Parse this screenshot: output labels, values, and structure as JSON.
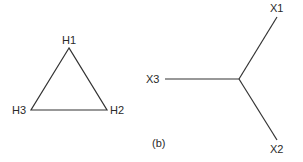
{
  "diagram": {
    "triangle": {
      "nodes": [
        {
          "id": "H1",
          "label": "H1"
        },
        {
          "id": "H2",
          "label": "H2"
        },
        {
          "id": "H3",
          "label": "H3"
        }
      ],
      "edges": [
        [
          "H1",
          "H2"
        ],
        [
          "H2",
          "H3"
        ],
        [
          "H3",
          "H1"
        ]
      ]
    },
    "star": {
      "center": "junction",
      "nodes": [
        {
          "id": "X1",
          "label": "X1"
        },
        {
          "id": "X2",
          "label": "X2"
        },
        {
          "id": "X3",
          "label": "X3"
        }
      ],
      "edges": [
        [
          "junction",
          "X1"
        ],
        [
          "junction",
          "X2"
        ],
        [
          "junction",
          "X3"
        ]
      ]
    },
    "caption": "(b)"
  }
}
